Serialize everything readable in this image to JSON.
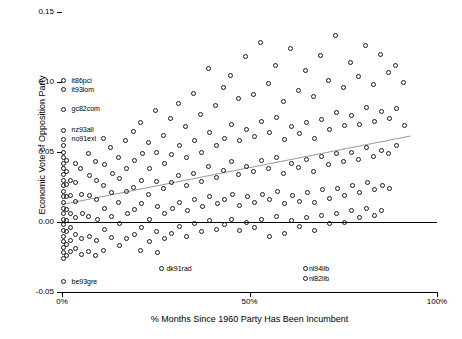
{
  "chart_data": {
    "type": "scatter",
    "title": "",
    "xlabel": "% Months Since 1960 Party Has Been Incumbent",
    "ylabel": "Economic Vote of Opposition Party",
    "xlim": [
      0,
      100
    ],
    "ylim": [
      -0.05,
      0.15
    ],
    "xticks": [
      0,
      50,
      100
    ],
    "xticklabels": [
      "0%",
      "50%",
      "100%"
    ],
    "yticks": [
      -0.05,
      0.0,
      0.05,
      0.1,
      0.15
    ],
    "yticklabels": [
      "-0.05",
      "0.00",
      "0.05",
      "0.10",
      "0.15"
    ],
    "grid": false,
    "legend": "none",
    "zero_line": 0.0,
    "trend_line": {
      "x0": 0,
      "y0": 0.013,
      "x1": 93,
      "y1": 0.062,
      "color": "#9a9a9a"
    },
    "annotations": [
      {
        "label": "it86pci",
        "x": 1.2,
        "y": 0.101
      },
      {
        "label": "it93lom",
        "x": 1.2,
        "y": 0.0945
      },
      {
        "label": "gc82com",
        "x": 1.2,
        "y": 0.0805
      },
      {
        "label": "nz93all",
        "x": 1.2,
        "y": 0.0655
      },
      {
        "label": "no91exl",
        "x": 1.2,
        "y": 0.059
      },
      {
        "label": "be93gre",
        "x": 1.2,
        "y": -0.0425
      },
      {
        "label": "dk91rad",
        "x": 26.5,
        "y": -0.0335
      },
      {
        "label": "nl94lib",
        "x": 64.5,
        "y": -0.0335
      },
      {
        "label": "nl82lib",
        "x": 64.5,
        "y": -0.0405
      }
    ],
    "points": [
      [
        0.3,
        0.101
      ],
      [
        0.3,
        0.0945
      ],
      [
        0.3,
        0.0805
      ],
      [
        0.3,
        0.0655
      ],
      [
        0.3,
        0.059
      ],
      [
        0.3,
        -0.0425
      ],
      [
        0.4,
        0.055
      ],
      [
        0.4,
        0.05
      ],
      [
        0.4,
        0.046
      ],
      [
        0.4,
        0.042
      ],
      [
        0.4,
        0.038
      ],
      [
        0.4,
        0.034
      ],
      [
        0.4,
        0.03
      ],
      [
        0.4,
        0.026
      ],
      [
        0.4,
        0.022
      ],
      [
        0.4,
        0.018
      ],
      [
        0.4,
        0.014
      ],
      [
        0.4,
        0.01
      ],
      [
        0.4,
        0.006
      ],
      [
        0.4,
        0.002
      ],
      [
        0.4,
        -0.002
      ],
      [
        0.4,
        -0.006
      ],
      [
        0.4,
        -0.01
      ],
      [
        0.4,
        -0.014
      ],
      [
        0.4,
        -0.018
      ],
      [
        0.4,
        -0.022
      ],
      [
        0.4,
        -0.026
      ],
      [
        1.2,
        0.044
      ],
      [
        1.2,
        0.036
      ],
      [
        1.2,
        0.027
      ],
      [
        1.2,
        0.018
      ],
      [
        1.2,
        0.009
      ],
      [
        1.2,
        0.001
      ],
      [
        1.2,
        -0.007
      ],
      [
        1.2,
        -0.016
      ],
      [
        1.2,
        -0.024
      ],
      [
        2.2,
        0.03
      ],
      [
        2.2,
        0.019
      ],
      [
        2.2,
        0.006
      ],
      [
        2.2,
        -0.004
      ],
      [
        2.2,
        -0.013
      ],
      [
        2.2,
        -0.021
      ],
      [
        3.5,
        0.042
      ],
      [
        3.5,
        0.028
      ],
      [
        3.5,
        0.015
      ],
      [
        3.5,
        0.003
      ],
      [
        3.5,
        -0.009
      ],
      [
        3.5,
        -0.019
      ],
      [
        5.0,
        0.038
      ],
      [
        5.2,
        0.02
      ],
      [
        5.4,
        0.006
      ],
      [
        5.1,
        -0.012
      ],
      [
        5.3,
        -0.023
      ],
      [
        7.0,
        0.049
      ],
      [
        7.2,
        0.033
      ],
      [
        7.4,
        0.019
      ],
      [
        7.1,
        0.004
      ],
      [
        7.3,
        -0.01
      ],
      [
        7.0,
        -0.021
      ],
      [
        9.0,
        0.043
      ],
      [
        9.3,
        0.03
      ],
      [
        9.1,
        0.016
      ],
      [
        9.4,
        0.002
      ],
      [
        9.2,
        -0.013
      ],
      [
        9.0,
        -0.024
      ],
      [
        11.0,
        0.06
      ],
      [
        11.3,
        0.041
      ],
      [
        11.1,
        0.026
      ],
      [
        11.4,
        0.01
      ],
      [
        11.2,
        -0.005
      ],
      [
        11.0,
        -0.02
      ],
      [
        13.0,
        0.053
      ],
      [
        13.4,
        0.035
      ],
      [
        13.1,
        0.021
      ],
      [
        13.3,
        0.004
      ],
      [
        13.2,
        -0.011
      ],
      [
        15.0,
        0.046
      ],
      [
        15.3,
        0.031
      ],
      [
        15.1,
        0.014
      ],
      [
        15.4,
        -0.001
      ],
      [
        15.2,
        -0.017
      ],
      [
        17.0,
        0.058
      ],
      [
        17.3,
        0.038
      ],
      [
        17.1,
        0.022
      ],
      [
        17.4,
        0.006
      ],
      [
        17.2,
        -0.012
      ],
      [
        19.0,
        0.065
      ],
      [
        19.3,
        0.044
      ],
      [
        19.1,
        0.025
      ],
      [
        19.4,
        0.009
      ],
      [
        19.2,
        -0.009
      ],
      [
        21.0,
        0.071
      ],
      [
        21.4,
        0.049
      ],
      [
        21.1,
        0.03
      ],
      [
        21.3,
        0.013
      ],
      [
        21.2,
        -0.004
      ],
      [
        21.0,
        -0.02
      ],
      [
        23.0,
        0.057
      ],
      [
        23.3,
        0.038
      ],
      [
        23.1,
        0.02
      ],
      [
        23.4,
        0.002
      ],
      [
        23.2,
        -0.014
      ],
      [
        25.0,
        0.08
      ],
      [
        25.3,
        0.05
      ],
      [
        25.1,
        0.029
      ],
      [
        25.4,
        0.011
      ],
      [
        25.2,
        -0.007
      ],
      [
        25.5,
        -0.022
      ],
      [
        26.5,
        -0.0335
      ],
      [
        27.0,
        0.062
      ],
      [
        27.3,
        0.042
      ],
      [
        27.1,
        0.024
      ],
      [
        27.4,
        0.006
      ],
      [
        27.2,
        -0.012
      ],
      [
        29.0,
        0.074
      ],
      [
        29.3,
        0.048
      ],
      [
        29.1,
        0.028
      ],
      [
        29.4,
        0.01
      ],
      [
        29.2,
        -0.008
      ],
      [
        31.0,
        0.085
      ],
      [
        31.3,
        0.055
      ],
      [
        31.1,
        0.033
      ],
      [
        31.4,
        0.014
      ],
      [
        31.2,
        -0.003
      ],
      [
        33.0,
        0.068
      ],
      [
        33.3,
        0.046
      ],
      [
        33.1,
        0.026
      ],
      [
        33.4,
        0.008
      ],
      [
        33.2,
        -0.01
      ],
      [
        35.0,
        0.092
      ],
      [
        35.3,
        0.058
      ],
      [
        35.1,
        0.035
      ],
      [
        35.4,
        0.016
      ],
      [
        35.2,
        -0.001
      ],
      [
        37.0,
        0.077
      ],
      [
        37.3,
        0.05
      ],
      [
        37.1,
        0.029
      ],
      [
        37.4,
        0.011
      ],
      [
        37.2,
        -0.007
      ],
      [
        39.0,
        0.11
      ],
      [
        39.3,
        0.064
      ],
      [
        39.1,
        0.04
      ],
      [
        39.4,
        0.018
      ],
      [
        39.2,
        0.001
      ],
      [
        41.0,
        0.083
      ],
      [
        41.3,
        0.055
      ],
      [
        41.1,
        0.032
      ],
      [
        41.4,
        0.013
      ],
      [
        41.2,
        -0.005
      ],
      [
        43.0,
        0.096
      ],
      [
        43.3,
        0.06
      ],
      [
        43.1,
        0.037
      ],
      [
        43.4,
        0.016
      ],
      [
        43.2,
        -0.002
      ],
      [
        45.0,
        0.105
      ],
      [
        45.3,
        0.07
      ],
      [
        45.1,
        0.043
      ],
      [
        45.4,
        0.02
      ],
      [
        45.2,
        0.002
      ],
      [
        47.0,
        0.088
      ],
      [
        47.3,
        0.058
      ],
      [
        47.1,
        0.034
      ],
      [
        47.4,
        0.012
      ],
      [
        47.2,
        -0.006
      ],
      [
        49.0,
        0.118
      ],
      [
        49.3,
        0.066
      ],
      [
        49.1,
        0.04
      ],
      [
        49.4,
        0.018
      ],
      [
        49.2,
        0.0
      ],
      [
        51.0,
        0.091
      ],
      [
        51.3,
        0.061
      ],
      [
        51.1,
        0.036
      ],
      [
        51.4,
        0.014
      ],
      [
        51.2,
        -0.004
      ],
      [
        53.0,
        0.128
      ],
      [
        53.3,
        0.072
      ],
      [
        53.1,
        0.044
      ],
      [
        53.4,
        0.02
      ],
      [
        53.2,
        0.002
      ],
      [
        55.0,
        0.099
      ],
      [
        55.3,
        0.064
      ],
      [
        55.1,
        0.038
      ],
      [
        55.4,
        0.016
      ],
      [
        55.2,
        -0.01
      ],
      [
        57.0,
        0.112
      ],
      [
        57.3,
        0.075
      ],
      [
        57.1,
        0.046
      ],
      [
        57.4,
        0.022
      ],
      [
        57.2,
        0.004
      ],
      [
        59.0,
        0.086
      ],
      [
        59.3,
        0.059
      ],
      [
        59.1,
        0.035
      ],
      [
        59.4,
        0.013
      ],
      [
        59.2,
        -0.008
      ],
      [
        61.0,
        0.124
      ],
      [
        61.3,
        0.068
      ],
      [
        61.1,
        0.042
      ],
      [
        61.4,
        0.019
      ],
      [
        61.2,
        0.001
      ],
      [
        63.0,
        0.094
      ],
      [
        63.3,
        0.063
      ],
      [
        63.1,
        0.039
      ],
      [
        63.4,
        0.015
      ],
      [
        63.2,
        -0.003
      ],
      [
        64.8,
        -0.0335
      ],
      [
        64.8,
        -0.0405
      ],
      [
        65.0,
        0.108
      ],
      [
        65.3,
        0.071
      ],
      [
        65.1,
        0.045
      ],
      [
        65.4,
        0.021
      ],
      [
        65.2,
        0.003
      ],
      [
        67.0,
        0.09
      ],
      [
        67.3,
        0.06
      ],
      [
        67.1,
        0.036
      ],
      [
        67.4,
        0.014
      ],
      [
        67.2,
        -0.006
      ],
      [
        69.0,
        0.119
      ],
      [
        69.3,
        0.073
      ],
      [
        69.1,
        0.047
      ],
      [
        69.4,
        0.023
      ],
      [
        69.2,
        0.005
      ],
      [
        71.0,
        0.101
      ],
      [
        71.3,
        0.066
      ],
      [
        71.1,
        0.041
      ],
      [
        71.4,
        0.017
      ],
      [
        71.2,
        -0.001
      ],
      [
        73.0,
        0.133
      ],
      [
        73.3,
        0.078
      ],
      [
        73.1,
        0.049
      ],
      [
        73.4,
        0.024
      ],
      [
        73.2,
        0.006
      ],
      [
        75.0,
        0.096
      ],
      [
        75.3,
        0.069
      ],
      [
        75.1,
        0.043
      ],
      [
        75.4,
        0.019
      ],
      [
        75.2,
        0.0
      ],
      [
        77.0,
        0.114
      ],
      [
        77.3,
        0.076
      ],
      [
        77.1,
        0.05
      ],
      [
        77.4,
        0.026
      ],
      [
        77.2,
        0.008
      ],
      [
        79.0,
        0.104
      ],
      [
        79.3,
        0.07
      ],
      [
        79.1,
        0.045
      ],
      [
        79.4,
        0.021
      ],
      [
        79.2,
        0.003
      ],
      [
        81.0,
        0.126
      ],
      [
        81.3,
        0.082
      ],
      [
        81.1,
        0.053
      ],
      [
        81.4,
        0.028
      ],
      [
        81.2,
        0.01
      ],
      [
        83.0,
        0.098
      ],
      [
        83.3,
        0.072
      ],
      [
        83.1,
        0.047
      ],
      [
        83.4,
        0.023
      ],
      [
        83.2,
        0.005
      ],
      [
        85.0,
        0.12
      ],
      [
        85.3,
        0.079
      ],
      [
        85.1,
        0.051
      ],
      [
        85.4,
        0.026
      ],
      [
        85.2,
        0.008
      ],
      [
        87.0,
        0.107
      ],
      [
        87.3,
        0.074
      ],
      [
        87.1,
        0.049
      ],
      [
        87.4,
        0.024
      ],
      [
        89.0,
        0.112
      ],
      [
        89.3,
        0.081
      ],
      [
        89.1,
        0.055
      ],
      [
        91.0,
        0.1
      ],
      [
        91.3,
        0.069
      ]
    ]
  }
}
